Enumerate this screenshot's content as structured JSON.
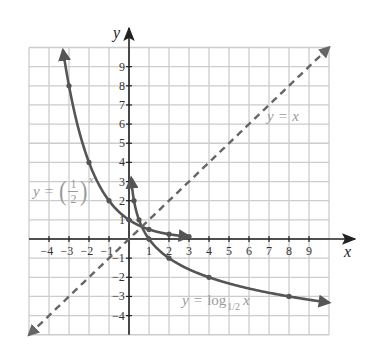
{
  "axes": {
    "x_label": "x",
    "y_label": "y"
  },
  "labels": {
    "identity": {
      "lhs": "y",
      "eq": "=",
      "rhs": "x"
    },
    "exponential": {
      "lhs": "y",
      "eq": "=",
      "open": "(",
      "num": "1",
      "den": "2",
      "close": ")",
      "exp": "x"
    },
    "logarithm": {
      "lhs": "y",
      "eq": "=",
      "fn": "log",
      "base": "1/2",
      "arg": "x"
    }
  },
  "colors": {
    "curve": "#555555",
    "dashed_line": "#666666",
    "axis": "#222222",
    "grid": "#cccccc",
    "annotation": "#9a9a9a"
  },
  "chart_data": {
    "type": "line",
    "title": "",
    "xlabel": "x",
    "ylabel": "y",
    "xlim": [
      -5,
      10
    ],
    "ylim": [
      -5,
      10
    ],
    "grid": true,
    "legend": "none (inline annotations)",
    "x_ticks": [
      -4,
      -3,
      -2,
      -1,
      1,
      2,
      3,
      4,
      5,
      6,
      7,
      8,
      9
    ],
    "y_ticks": [
      -4,
      -3,
      -2,
      -1,
      1,
      2,
      3,
      4,
      5,
      6,
      7,
      8,
      9
    ],
    "series": [
      {
        "name": "y = (1/2)^x",
        "kind": "exponential_half",
        "style": "solid",
        "domain": [
          -3.3,
          3.0
        ],
        "points": [
          [
            -3,
            8
          ],
          [
            -2,
            4
          ],
          [
            -1,
            2
          ],
          [
            0,
            1
          ],
          [
            1,
            0.5
          ],
          [
            2,
            0.25
          ],
          [
            3,
            0.125
          ]
        ]
      },
      {
        "name": "y = log_{1/2} x",
        "kind": "log_half",
        "style": "solid",
        "domain": [
          0.11,
          10
        ],
        "points": [
          [
            0.125,
            3
          ],
          [
            0.25,
            2
          ],
          [
            0.5,
            1
          ],
          [
            1,
            0
          ],
          [
            2,
            -1
          ],
          [
            4,
            -2
          ],
          [
            8,
            -3
          ]
        ]
      },
      {
        "name": "y = x",
        "kind": "identity",
        "style": "dashed",
        "domain": [
          -5,
          10
        ],
        "points": []
      }
    ],
    "annotations": [
      {
        "text": "y = x",
        "x": 7.0,
        "y": 6.3
      },
      {
        "text": "y = (1/2)^x",
        "x": -4.7,
        "y": 2.5
      },
      {
        "text": "y = log_{1/2} x",
        "x": 2.7,
        "y": -3.2
      }
    ]
  }
}
